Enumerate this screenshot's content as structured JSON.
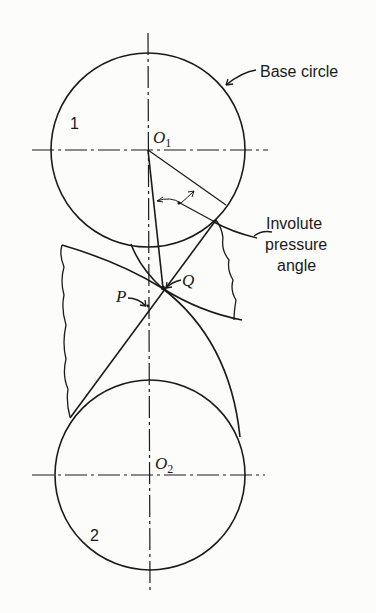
{
  "figure": {
    "type": "involute gear tooth contact diagram",
    "labels": {
      "base_circle": "Base circle",
      "gear1": "1",
      "gear2": "2",
      "center1_letter": "O",
      "center1_sub": "1",
      "center2_letter": "O",
      "center2_sub": "2",
      "point_p": "P",
      "point_q": "Q",
      "pressure_line1": "Involute",
      "pressure_line2": "pressure",
      "pressure_line3": "angle"
    },
    "colors": {
      "ink": "#1a1a1a",
      "background": "#fcfcfa"
    }
  }
}
